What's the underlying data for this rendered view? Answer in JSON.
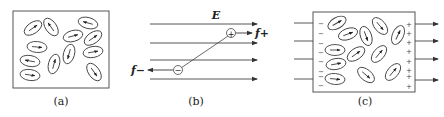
{
  "panels": [
    {
      "id": "a",
      "caption": "(a)",
      "description": "Randomly oriented molecular dipoles with no applied field"
    },
    {
      "id": "b",
      "caption": "(b)",
      "description": "A dipole in a uniform electric field E experiences forces f+ and f-",
      "field_label": "E",
      "force_plus_label": "f+",
      "force_minus_label": "f−",
      "plus_sign": "+",
      "minus_sign": "−"
    },
    {
      "id": "c",
      "caption": "(c)",
      "description": "Dielectric polarized in a field, surface charges appear",
      "left_charge": "−",
      "right_charge": "+",
      "left_charges_count": 8,
      "right_charges_count": 8
    }
  ],
  "colors": {
    "stroke": "#444444",
    "background": "#ffffff"
  }
}
